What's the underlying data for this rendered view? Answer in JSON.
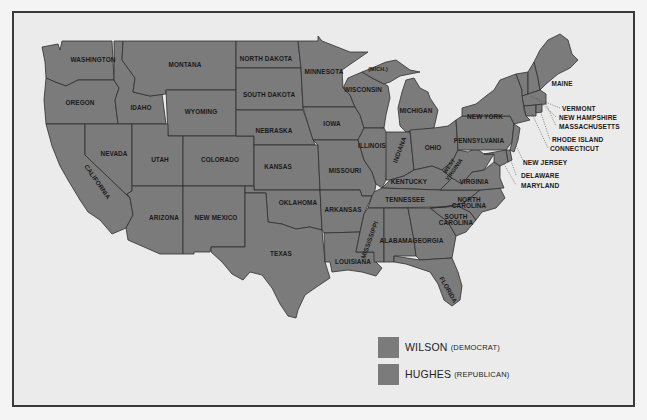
{
  "map": {
    "title": "",
    "colors": {
      "state_fill": "#7b7b7b",
      "background": "#ebebeb",
      "border": "#2f2f2f",
      "frame": "#3a3a3a"
    },
    "states": [
      {
        "name": "WASHINGTON",
        "label": "WASHINGTON"
      },
      {
        "name": "OREGON",
        "label": "OREGON"
      },
      {
        "name": "CALIFORNIA",
        "label": "CALIFORNIA"
      },
      {
        "name": "IDAHO",
        "label": "IDAHO"
      },
      {
        "name": "NEVADA",
        "label": "NEVADA"
      },
      {
        "name": "MONTANA",
        "label": "MONTANA"
      },
      {
        "name": "WYOMING",
        "label": "WYOMING"
      },
      {
        "name": "UTAH",
        "label": "UTAH"
      },
      {
        "name": "ARIZONA",
        "label": "ARIZONA"
      },
      {
        "name": "COLORADO",
        "label": "COLORADO"
      },
      {
        "name": "NEW MEXICO",
        "label": "NEW MEXICO"
      },
      {
        "name": "NORTH DAKOTA",
        "label": "NORTH DAKOTA"
      },
      {
        "name": "SOUTH DAKOTA",
        "label": "SOUTH DAKOTA"
      },
      {
        "name": "NEBRASKA",
        "label": "NEBRASKA"
      },
      {
        "name": "KANSAS",
        "label": "KANSAS"
      },
      {
        "name": "OKLAHOMA",
        "label": "OKLAHOMA"
      },
      {
        "name": "TEXAS",
        "label": "TEXAS"
      },
      {
        "name": "MINNESOTA",
        "label": "MINNESOTA"
      },
      {
        "name": "IOWA",
        "label": "IOWA"
      },
      {
        "name": "MISSOURI",
        "label": "MISSOURI"
      },
      {
        "name": "ARKANSAS",
        "label": "ARKANSAS"
      },
      {
        "name": "LOUISIANA",
        "label": "LOUISIANA"
      },
      {
        "name": "WISCONSIN",
        "label": "WISCONSIN"
      },
      {
        "name": "MICHIGAN UP",
        "label": "(MICH.)"
      },
      {
        "name": "MICHIGAN",
        "label": "MICHIGAN"
      },
      {
        "name": "ILLINOIS",
        "label": "ILLINOIS"
      },
      {
        "name": "INDIANA",
        "label": "INDIANA"
      },
      {
        "name": "OHIO",
        "label": "OHIO"
      },
      {
        "name": "KENTUCKY",
        "label": "KENTUCKY"
      },
      {
        "name": "TENNESSEE",
        "label": "TENNESSEE"
      },
      {
        "name": "MISSISSIPPI",
        "label": "MISSISSIPPI"
      },
      {
        "name": "ALABAMA",
        "label": "ALABAMA"
      },
      {
        "name": "GEORGIA",
        "label": "GEORGIA"
      },
      {
        "name": "FLORIDA",
        "label": "FLORIDA"
      },
      {
        "name": "SOUTH CAROLINA",
        "label": "SOUTH\nCAROLINA"
      },
      {
        "name": "NORTH CAROLINA",
        "label": "NORTH\nCAROLINA"
      },
      {
        "name": "VIRGINIA",
        "label": "VIRGINIA"
      },
      {
        "name": "WEST VIRGINIA",
        "label": "WEST\nVIRGINIA"
      },
      {
        "name": "PENNSYLVANIA",
        "label": "PENNSYLVANIA"
      },
      {
        "name": "NEW YORK",
        "label": "NEW YORK"
      },
      {
        "name": "MAINE",
        "label": "MAINE"
      }
    ],
    "callouts": [
      {
        "label": "VERMONT"
      },
      {
        "label": "NEW HAMPSHIRE"
      },
      {
        "label": "MASSACHUSETTS"
      },
      {
        "label": "RHODE ISLAND"
      },
      {
        "label": "CONNECTICUT"
      },
      {
        "label": "NEW JERSEY"
      },
      {
        "label": "DELAWARE"
      },
      {
        "label": "MARYLAND"
      }
    ]
  },
  "legend": {
    "items": [
      {
        "name": "WILSON",
        "party": "(DEMOCRAT)",
        "color": "#7b7b7b"
      },
      {
        "name": "HUGHES",
        "party": "(REPUBLICAN)",
        "color": "#7b7b7b"
      }
    ]
  }
}
